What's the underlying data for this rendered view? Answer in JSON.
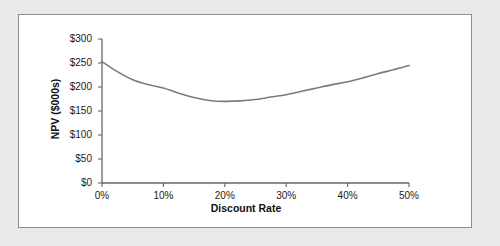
{
  "figure": {
    "background_color": "#e9e9e9",
    "panel_color": "#ffffff",
    "panel_border_color": "#8d8d8d"
  },
  "chart_data": {
    "type": "line",
    "title": "",
    "subtitle": "",
    "xlabel": "Discount Rate",
    "ylabel": "NPV ($000s)",
    "xlim": [
      0,
      50
    ],
    "ylim": [
      0,
      300
    ],
    "grid": false,
    "legend": "none",
    "line_color": "#7b7b7b",
    "line_width": 1.6,
    "x_tick_labels": [
      "0%",
      "10%",
      "20%",
      "30%",
      "40%",
      "50%"
    ],
    "x_tick_values": [
      0,
      10,
      20,
      30,
      40,
      50
    ],
    "y_tick_labels": [
      "$0",
      "$50",
      "$100",
      "$150",
      "$200",
      "$250",
      "$300"
    ],
    "y_tick_values": [
      0,
      50,
      100,
      150,
      200,
      250,
      300
    ],
    "series": [
      {
        "name": "NPV",
        "x": [
          0,
          2.5,
          5,
          7.5,
          10,
          12.5,
          15,
          17.5,
          20,
          22.5,
          25,
          27.5,
          30,
          32.5,
          35,
          37.5,
          40,
          42.5,
          45,
          47.5,
          50
        ],
        "values": [
          253,
          232,
          215,
          205,
          198,
          187,
          178,
          172,
          170,
          171,
          174,
          179,
          184,
          191,
          198,
          205,
          211,
          219,
          228,
          236,
          245
        ]
      }
    ],
    "annotations": []
  }
}
